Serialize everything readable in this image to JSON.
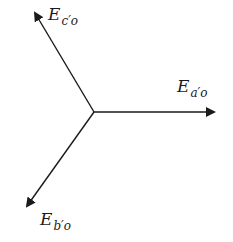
{
  "diagram": {
    "title": "",
    "type": "phasor-diagram",
    "origin": {
      "x": 94,
      "y": 112
    },
    "stroke_color": "#1a1a1a",
    "phasors": [
      {
        "id": "a",
        "main": "E",
        "subscript": "a′o",
        "tip": {
          "x": 214,
          "y": 112
        }
      },
      {
        "id": "b",
        "main": "E",
        "subscript": "b′o",
        "tip": {
          "x": 26,
          "y": 207
        }
      },
      {
        "id": "c",
        "main": "E",
        "subscript": "c′o",
        "tip": {
          "x": 34,
          "y": 12
        }
      }
    ]
  }
}
